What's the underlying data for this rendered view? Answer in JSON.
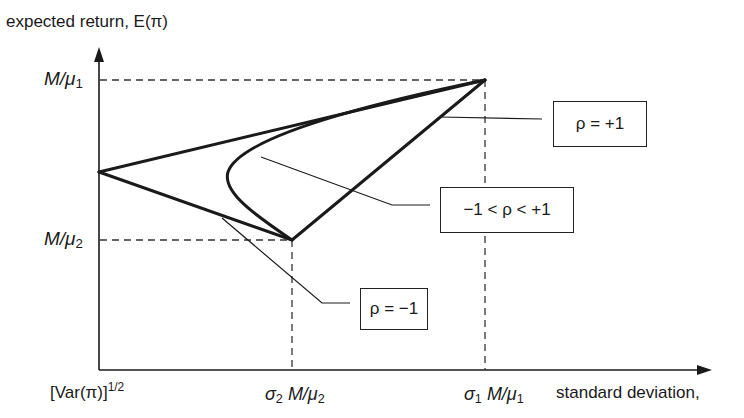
{
  "diagram": {
    "y_axis_title": "expected return, E(π)",
    "x_axis_title": "standard deviation,",
    "y_ticks": [
      {
        "prefix": "M/μ",
        "sub": "1"
      },
      {
        "prefix": "M/μ",
        "sub": "2"
      }
    ],
    "x_ticks": [
      {
        "text": "[Var(π)]",
        "sup": "1/2"
      },
      {
        "sigma": "σ",
        "sigma_sub": "2",
        "prefix": " M/μ",
        "sub": "2"
      },
      {
        "sigma": "σ",
        "sigma_sub": "1",
        "prefix": " M/μ",
        "sub": "1"
      }
    ],
    "annotations": [
      {
        "id": "rho-plus-one",
        "text": "ρ = +1"
      },
      {
        "id": "rho-between",
        "text": "−1 < ρ < +1"
      },
      {
        "id": "rho-minus-one",
        "text": "ρ = −1"
      }
    ],
    "points": {
      "asset1": {
        "label": "(σ1 M/μ1, M/μ1)"
      },
      "asset2": {
        "label": "(σ2 M/μ2, M/μ2)"
      },
      "zero_var": {
        "label": "([Var(π)]^1/2 intercept)"
      }
    },
    "colors": {
      "line": "#1a1a1a",
      "dash": "#333333"
    }
  }
}
